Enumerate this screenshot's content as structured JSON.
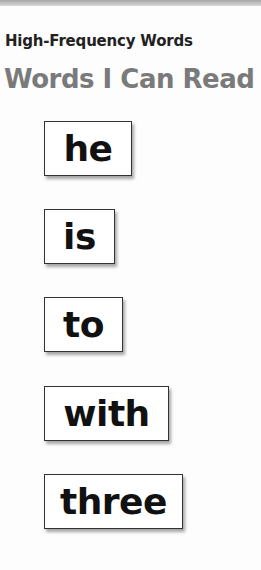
{
  "header": {
    "subtitle": "High-Frequency Words",
    "title": "Words I Can Read"
  },
  "words": [
    {
      "text": "he"
    },
    {
      "text": "is"
    },
    {
      "text": "to"
    },
    {
      "text": "with"
    },
    {
      "text": "three"
    }
  ],
  "colors": {
    "title": "#7a7a7a",
    "subtitle": "#222222",
    "card_border": "#333333"
  }
}
